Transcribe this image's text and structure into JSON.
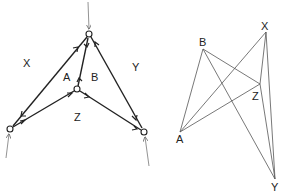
{
  "left_diagram": {
    "labels": {
      "X": "X",
      "A": "A",
      "B": "B",
      "Y": "Y",
      "Z": "Z"
    },
    "nodes": {
      "top": [
        89,
        34
      ],
      "center": [
        77,
        89
      ],
      "left": [
        10,
        129
      ],
      "right": [
        144,
        132
      ]
    },
    "edges": [
      {
        "from": "top",
        "to": "left",
        "double": true
      },
      {
        "from": "top",
        "to": "center",
        "double": true
      },
      {
        "from": "top",
        "to": "right",
        "double": true
      },
      {
        "from": "center",
        "to": "left",
        "double": true
      },
      {
        "from": "center",
        "to": "right",
        "double": true
      }
    ],
    "external_inputs": [
      "top",
      "left",
      "right"
    ]
  },
  "right_diagram": {
    "labels": {
      "X": "X",
      "B": "B",
      "Z": "Z",
      "A": "A",
      "Y": "Y"
    },
    "vertices": {
      "X": [
        266,
        32
      ],
      "B": [
        203,
        49
      ],
      "Z": [
        260,
        84
      ],
      "A": [
        180,
        132
      ],
      "Y": [
        275,
        179
      ]
    },
    "edges": [
      [
        "B",
        "A"
      ],
      [
        "B",
        "Z"
      ],
      [
        "B",
        "Y"
      ],
      [
        "X",
        "A"
      ],
      [
        "X",
        "Z"
      ],
      [
        "X",
        "Y"
      ],
      [
        "Z",
        "A"
      ],
      [
        "Z",
        "Y"
      ]
    ]
  },
  "colors": {
    "ink": "#222222",
    "thin": "#555555"
  }
}
